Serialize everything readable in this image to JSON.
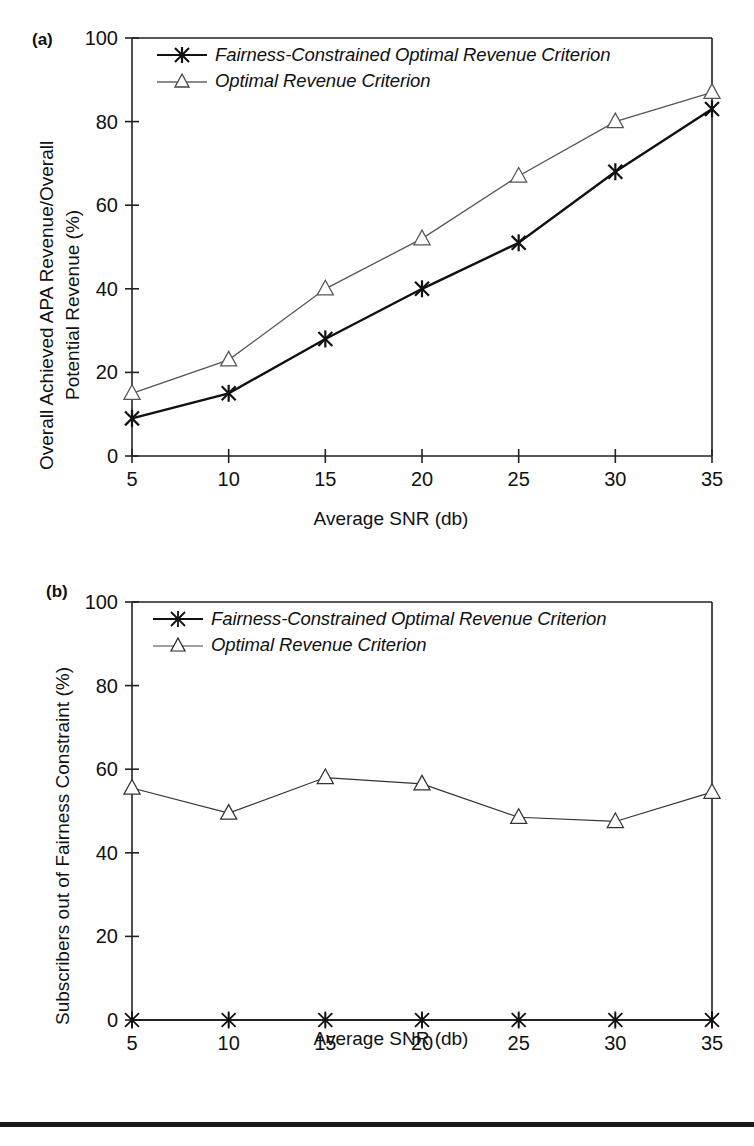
{
  "figure": {
    "bottom_rule_color": "#1a1a1a",
    "background": "#ffffff"
  },
  "panels": [
    {
      "id": "a",
      "label": "(a)",
      "ylabel_line1": "Overall Achieved APA Revenue/Overall",
      "ylabel_line2": "Potential Revenue (%)",
      "xlabel": "Average SNR (db)",
      "legend": [
        {
          "marker": "star-marker",
          "label": "Fairness-Constrained Optimal Revenue Criterion",
          "color": "#111111"
        },
        {
          "marker": "triangle-marker",
          "label": "Optimal Revenue Criterion",
          "color": "#555555"
        }
      ]
    },
    {
      "id": "b",
      "label": "(b)",
      "ylabel_line1": "Subscribers out of Fairness Constraint (%)",
      "xlabel": "Average SNR (db)",
      "legend": [
        {
          "marker": "star-marker",
          "label": "Fairness-Constrained Optimal Revenue Criterion",
          "color": "#111111"
        },
        {
          "marker": "triangle-marker",
          "label": "Optimal Revenue Criterion",
          "color": "#555555"
        }
      ]
    }
  ],
  "chart_data": [
    {
      "type": "line",
      "panel": "a",
      "title": "",
      "xlabel": "Average SNR (db)",
      "ylabel": "Overall Achieved APA Revenue/Overall Potential Revenue (%)",
      "x": [
        5,
        10,
        15,
        20,
        25,
        30,
        35
      ],
      "categories": [
        "5",
        "10",
        "15",
        "20",
        "25",
        "30",
        "35"
      ],
      "xlim": [
        5,
        35
      ],
      "ylim": [
        0,
        100
      ],
      "xticks": [
        5,
        10,
        15,
        20,
        25,
        30,
        35
      ],
      "yticks": [
        0,
        20,
        40,
        60,
        80,
        100
      ],
      "grid": false,
      "legend_position": "upper-left-inside",
      "series": [
        {
          "name": "Fairness-Constrained Optimal Revenue Criterion",
          "marker": "star",
          "color": "#111111",
          "linewidth": 2.4,
          "values": [
            9,
            15,
            28,
            40,
            51,
            68,
            83
          ]
        },
        {
          "name": "Optimal Revenue Criterion",
          "marker": "triangle",
          "color": "#555555",
          "linewidth": 1.3,
          "values": [
            15,
            23,
            40,
            52,
            67,
            80,
            87
          ]
        }
      ]
    },
    {
      "type": "line",
      "panel": "b",
      "title": "",
      "xlabel": "Average SNR (db)",
      "ylabel": "Subscribers out of Fairness Constraint (%)",
      "x": [
        5,
        10,
        15,
        20,
        25,
        30,
        35
      ],
      "categories": [
        "5",
        "10",
        "15",
        "20",
        "25",
        "30",
        "35"
      ],
      "xlim": [
        5,
        35
      ],
      "ylim": [
        0,
        100
      ],
      "xticks": [
        5,
        10,
        15,
        20,
        25,
        30,
        35
      ],
      "yticks": [
        0,
        20,
        40,
        60,
        80,
        100
      ],
      "grid": false,
      "legend_position": "upper-left-inside",
      "series": [
        {
          "name": "Fairness-Constrained Optimal Revenue Criterion",
          "marker": "star",
          "color": "#111111",
          "linewidth": 1.4,
          "values": [
            0,
            0,
            0,
            0,
            0,
            0,
            0
          ]
        },
        {
          "name": "Optimal Revenue Criterion",
          "marker": "triangle",
          "color": "#333333",
          "linewidth": 1.2,
          "values": [
            55.5,
            49.5,
            58,
            56.5,
            48.5,
            47.5,
            54.5
          ]
        }
      ]
    }
  ]
}
